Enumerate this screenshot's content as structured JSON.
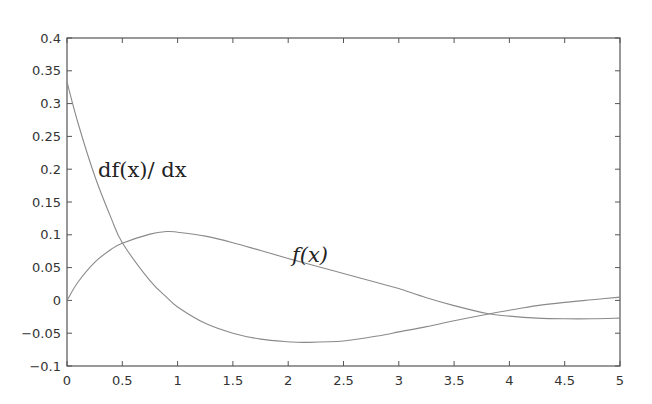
{
  "chart_data": {
    "type": "line",
    "title": "",
    "xlabel": "",
    "ylabel": "",
    "xlim": [
      0,
      5
    ],
    "ylim": [
      -0.1,
      0.4
    ],
    "grid": false,
    "legend": "none (inline curve annotations)",
    "x_ticks": [
      "0",
      "0.5",
      "1",
      "1.5",
      "2",
      "2.5",
      "3",
      "3.5",
      "4",
      "4.5",
      "5"
    ],
    "y_ticks": [
      "-0.1",
      "-0.05",
      "0",
      "0.05",
      "0.1",
      "0.15",
      "0.2",
      "0.25",
      "0.3",
      "0.35",
      "0.4"
    ],
    "x": [
      0,
      0.1,
      0.25,
      0.4,
      0.5,
      0.75,
      0.9,
      1.0,
      1.25,
      1.5,
      1.75,
      2.0,
      2.15,
      2.5,
      2.85,
      3.0,
      3.25,
      3.5,
      3.8,
      4.0,
      4.25,
      4.5,
      4.75,
      5.0
    ],
    "series": [
      {
        "name": "f(x)",
        "annotation": "f(x)",
        "annotation_pos": [
          2.6,
          0.07
        ],
        "color": "#8a8a8a",
        "values": [
          0.0,
          0.028,
          0.058,
          0.078,
          0.087,
          0.101,
          0.105,
          0.104,
          0.098,
          0.088,
          0.076,
          0.064,
          0.057,
          0.041,
          0.025,
          0.018,
          0.004,
          -0.008,
          -0.02,
          -0.024,
          -0.027,
          -0.028,
          -0.028,
          -0.027
        ]
      },
      {
        "name": "df(x)/dx",
        "annotation": "df(x)/dx",
        "annotation_pos": [
          0.27,
          0.195
        ],
        "color": "#8a8a8a",
        "values": [
          0.333,
          0.27,
          0.19,
          0.125,
          0.088,
          0.03,
          0.005,
          -0.01,
          -0.035,
          -0.05,
          -0.059,
          -0.063,
          -0.064,
          -0.062,
          -0.053,
          -0.048,
          -0.04,
          -0.031,
          -0.021,
          -0.015,
          -0.008,
          -0.003,
          0.001,
          0.005
        ]
      }
    ],
    "intersections": [
      {
        "x": 0.48,
        "y": 0.088
      },
      {
        "x": 3.8,
        "y": -0.022
      }
    ]
  },
  "labels": {
    "f": "f(x)",
    "df": "df(x)/ dx"
  }
}
